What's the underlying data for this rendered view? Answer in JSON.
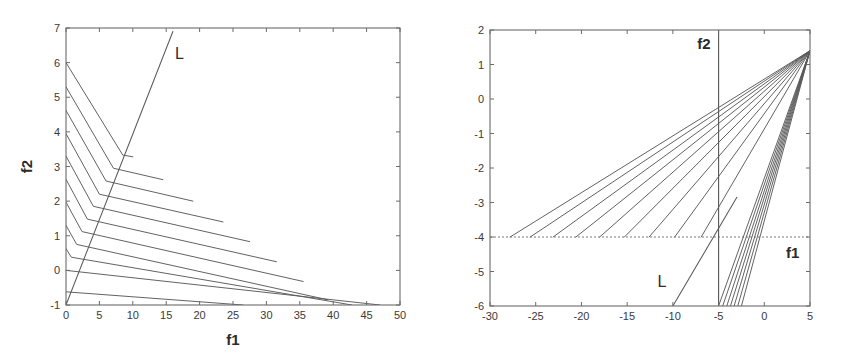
{
  "figure": {
    "background": "#ffffff",
    "line_color": "#5a5a5a",
    "axis_color": "#6b6b6b",
    "text_color": "#2b2b2b",
    "panels": [
      "left",
      "right"
    ]
  },
  "chart_data": [
    {
      "id": "left-plot",
      "type": "line",
      "title": "",
      "xlabel": "f1",
      "ylabel": "f2",
      "xlim": [
        0,
        50
      ],
      "ylim": [
        -1,
        7
      ],
      "xticks": [
        0,
        5,
        10,
        15,
        20,
        25,
        30,
        35,
        40,
        45,
        50
      ],
      "xticklabels": [
        "0",
        "5",
        "10",
        "15",
        "20",
        "25",
        "30",
        "35",
        "40",
        "45",
        "50"
      ],
      "yticks": [
        -1,
        0,
        1,
        2,
        3,
        4,
        5,
        6,
        7
      ],
      "yticklabels": [
        "-1",
        "0",
        "1",
        "2",
        "3",
        "4",
        "5",
        "6",
        "7"
      ],
      "grid": false,
      "legend": "none",
      "annotations": [
        {
          "text": "L",
          "x": 17.0,
          "y": 6.1
        }
      ],
      "series": [
        {
          "name": "L",
          "kind": "boundary-line",
          "points": [
            [
              0,
              -1
            ],
            [
              16.0,
              6.9
            ]
          ]
        },
        {
          "name": "contour-1",
          "kind": "piecewise-contour",
          "points": [
            [
              0,
              6.0
            ],
            [
              8.5,
              3.33
            ],
            [
              10.0,
              3.28
            ]
          ]
        },
        {
          "name": "contour-2",
          "kind": "piecewise-contour",
          "points": [
            [
              0,
              5.3
            ],
            [
              7.1,
              2.95
            ],
            [
              14.5,
              2.62
            ]
          ]
        },
        {
          "name": "contour-3",
          "kind": "piecewise-contour",
          "points": [
            [
              0,
              4.62
            ],
            [
              6.0,
              2.58
            ],
            [
              19.0,
              2.0
            ]
          ]
        },
        {
          "name": "contour-4",
          "kind": "piecewise-contour",
          "points": [
            [
              0,
              3.95
            ],
            [
              5.0,
              2.2
            ],
            [
              23.5,
              1.4
            ]
          ]
        },
        {
          "name": "contour-5",
          "kind": "piecewise-contour",
          "points": [
            [
              0,
              3.3
            ],
            [
              4.1,
              1.85
            ],
            [
              27.5,
              0.83
            ]
          ]
        },
        {
          "name": "contour-6",
          "kind": "piecewise-contour",
          "points": [
            [
              0,
              2.63
            ],
            [
              3.2,
              1.48
            ],
            [
              31.5,
              0.25
            ]
          ]
        },
        {
          "name": "contour-7",
          "kind": "piecewise-contour",
          "points": [
            [
              0,
              1.97
            ],
            [
              2.4,
              1.12
            ],
            [
              35.5,
              -0.32
            ]
          ]
        },
        {
          "name": "contour-8",
          "kind": "piecewise-contour",
          "points": [
            [
              0,
              1.3
            ],
            [
              1.6,
              0.75
            ],
            [
              39.2,
              -0.85
            ]
          ]
        },
        {
          "name": "contour-9",
          "kind": "piecewise-contour",
          "points": [
            [
              0,
              0.63
            ],
            [
              0.8,
              0.38
            ],
            [
              42.8,
              -1.0
            ]
          ]
        },
        {
          "name": "contour-10",
          "kind": "piecewise-contour",
          "points": [
            [
              0,
              0.0
            ],
            [
              47.0,
              -1.0
            ]
          ]
        },
        {
          "name": "contour-11",
          "kind": "piecewise-contour",
          "points": [
            [
              0,
              -0.62
            ],
            [
              26.5,
              -1.0
            ]
          ]
        }
      ]
    },
    {
      "id": "right-plot",
      "type": "line",
      "title": "",
      "xlabel": "f1",
      "ylabel": "f2",
      "xlim": [
        -30,
        5
      ],
      "ylim": [
        -6,
        2
      ],
      "xticks": [
        -30,
        -25,
        -20,
        -15,
        -10,
        -5,
        0,
        5
      ],
      "xticklabels": [
        "-30",
        "-25",
        "-20",
        "-15",
        "-10",
        "-5",
        "0",
        "5"
      ],
      "yticks": [
        -6,
        -5,
        -4,
        -3,
        -2,
        -1,
        0,
        1,
        2
      ],
      "yticklabels": [
        "-6",
        "-5",
        "-4",
        "-3",
        "-2",
        "-1",
        "0",
        "1",
        "2"
      ],
      "grid": false,
      "legend": "none",
      "annotations": [
        {
          "text": "f2",
          "x": -6.6,
          "y": 1.45
        },
        {
          "text": "f1",
          "x": 3.1,
          "y": -4.6
        },
        {
          "text": "L",
          "x": -11.2,
          "y": -5.45
        }
      ],
      "reference_lines": [
        {
          "name": "f2-axis",
          "orientation": "vertical",
          "value": -5,
          "style": "solid"
        },
        {
          "name": "f1-axis",
          "orientation": "horizontal",
          "value": -4,
          "style": "dashed"
        }
      ],
      "apex": [
        5,
        1.4
      ],
      "series": [
        {
          "name": "L",
          "kind": "boundary-line",
          "points": [
            [
              -10.0,
              -6.0
            ],
            [
              -3.0,
              -2.85
            ]
          ]
        },
        {
          "name": "vertical-edge",
          "kind": "boundary-line",
          "points": [
            [
              -5.0,
              -6.0
            ],
            [
              -5.0,
              2.0
            ]
          ]
        },
        {
          "name": "fan-1",
          "kind": "ray-to-apex",
          "start": [
            -27.8,
            -4.0
          ]
        },
        {
          "name": "fan-2",
          "kind": "ray-to-apex",
          "start": [
            -25.6,
            -4.0
          ]
        },
        {
          "name": "fan-3",
          "kind": "ray-to-apex",
          "start": [
            -23.1,
            -4.0
          ]
        },
        {
          "name": "fan-4",
          "kind": "ray-to-apex",
          "start": [
            -20.6,
            -4.0
          ]
        },
        {
          "name": "fan-5",
          "kind": "ray-to-apex",
          "start": [
            -18.0,
            -4.0
          ]
        },
        {
          "name": "fan-6",
          "kind": "ray-to-apex",
          "start": [
            -15.3,
            -4.0
          ]
        },
        {
          "name": "fan-7",
          "kind": "ray-to-apex",
          "start": [
            -12.6,
            -4.0
          ]
        },
        {
          "name": "fan-8",
          "kind": "ray-to-apex",
          "start": [
            -9.8,
            -4.0
          ]
        },
        {
          "name": "fan-9",
          "kind": "ray-to-apex",
          "start": [
            -6.9,
            -4.0
          ]
        },
        {
          "name": "fan-10",
          "kind": "ray-to-apex",
          "start": [
            -5.0,
            -6.0
          ]
        },
        {
          "name": "fan-11",
          "kind": "ray-to-apex",
          "start": [
            -4.55,
            -6.0
          ]
        },
        {
          "name": "fan-12",
          "kind": "ray-to-apex",
          "start": [
            -4.1,
            -6.0
          ]
        },
        {
          "name": "fan-13",
          "kind": "ray-to-apex",
          "start": [
            -3.7,
            -6.0
          ]
        },
        {
          "name": "fan-14",
          "kind": "ray-to-apex",
          "start": [
            -3.3,
            -6.0
          ]
        },
        {
          "name": "fan-15",
          "kind": "ray-to-apex",
          "start": [
            -2.9,
            -6.0
          ]
        },
        {
          "name": "fan-16",
          "kind": "ray-to-apex",
          "start": [
            -2.5,
            -6.0
          ]
        }
      ]
    }
  ]
}
